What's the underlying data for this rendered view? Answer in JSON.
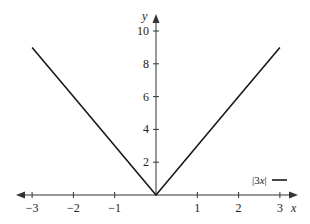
{
  "chart_data": {
    "type": "line",
    "title": "",
    "xlabel": "x",
    "ylabel": "y",
    "xlim": [
      -3,
      3
    ],
    "ylim": [
      0,
      10
    ],
    "xticks": [
      -3,
      -2,
      -1,
      1,
      2,
      3
    ],
    "xtick_labels": [
      "−3",
      "−2",
      "−1",
      "1",
      "2",
      "3"
    ],
    "yticks": [
      2,
      4,
      6,
      8,
      10
    ],
    "ytick_labels": [
      "2",
      "4",
      "6",
      "8",
      "10"
    ],
    "grid": false,
    "legend_position": "lower right",
    "series": [
      {
        "name": "|3x|",
        "color": "#1a1a1a",
        "x": [
          -3,
          -2,
          -1,
          0,
          1,
          2,
          3
        ],
        "y": [
          9,
          6,
          3,
          0,
          3,
          6,
          9
        ]
      }
    ]
  },
  "legend": {
    "label_prefix": "|3",
    "label_var": "x",
    "label_suffix": "|"
  },
  "axes": {
    "x_label": "x",
    "y_label": "y",
    "color": "#333333"
  }
}
